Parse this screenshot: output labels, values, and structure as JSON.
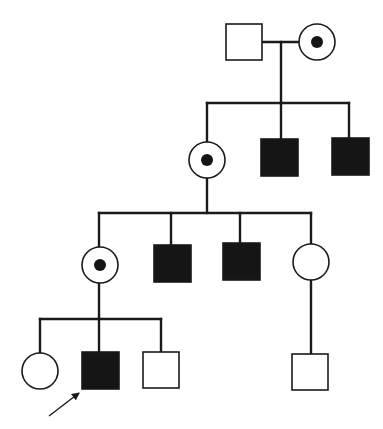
{
  "diagram": {
    "type": "pedigree",
    "colors": {
      "line": "#1a1a1a",
      "affected_fill": "#151515",
      "background": "#ffffff"
    },
    "legend_semantics": {
      "square": "male",
      "circle": "female",
      "filled": "affected",
      "dot": "carrier",
      "arrow": "proband"
    },
    "individuals": [
      {
        "id": "I-1",
        "gen": 1,
        "sex": "male",
        "status": "unaffected",
        "shape": "square",
        "x": 226,
        "y": 24,
        "size": 36
      },
      {
        "id": "I-2",
        "gen": 1,
        "sex": "female",
        "status": "carrier",
        "shape": "circle",
        "cx": 317,
        "cy": 42,
        "r": 18
      },
      {
        "id": "II-1",
        "gen": 2,
        "sex": "female",
        "status": "carrier",
        "shape": "circle",
        "cx": 207,
        "cy": 160,
        "r": 18
      },
      {
        "id": "II-2",
        "gen": 2,
        "sex": "male",
        "status": "affected",
        "shape": "square",
        "x": 261,
        "y": 139,
        "size": 37
      },
      {
        "id": "II-3",
        "gen": 2,
        "sex": "male",
        "status": "affected",
        "shape": "square",
        "x": 332,
        "y": 138,
        "size": 37
      },
      {
        "id": "III-1",
        "gen": 3,
        "sex": "female",
        "status": "carrier",
        "shape": "circle",
        "cx": 100,
        "cy": 265,
        "r": 18
      },
      {
        "id": "III-2",
        "gen": 3,
        "sex": "male",
        "status": "affected",
        "shape": "square",
        "x": 154,
        "y": 245,
        "size": 37
      },
      {
        "id": "III-3",
        "gen": 3,
        "sex": "male",
        "status": "affected",
        "shape": "square",
        "x": 223,
        "y": 243,
        "size": 37
      },
      {
        "id": "III-4",
        "gen": 3,
        "sex": "female",
        "status": "unaffected",
        "shape": "circle",
        "cx": 311,
        "cy": 262,
        "r": 18
      },
      {
        "id": "IV-1",
        "gen": 4,
        "sex": "female",
        "status": "unaffected",
        "shape": "circle",
        "cx": 40,
        "cy": 371,
        "r": 18
      },
      {
        "id": "IV-2",
        "gen": 4,
        "sex": "male",
        "status": "affected",
        "shape": "square",
        "x": 82,
        "y": 352,
        "size": 37,
        "proband": true
      },
      {
        "id": "IV-3",
        "gen": 4,
        "sex": "male",
        "status": "unaffected",
        "shape": "square",
        "x": 143,
        "y": 352,
        "size": 36
      },
      {
        "id": "IV-4",
        "gen": 4,
        "sex": "male",
        "status": "unaffected",
        "shape": "square",
        "x": 292,
        "y": 354,
        "size": 36
      }
    ],
    "lines": [
      {
        "name": "marriage-line-gen1",
        "x1": 262,
        "y1": 42,
        "x2": 299,
        "y2": 42
      },
      {
        "name": "descent-line-gen1",
        "x1": 281,
        "y1": 42,
        "x2": 281,
        "y2": 103
      },
      {
        "name": "sibship-line-gen2",
        "x1": 207,
        "y1": 103,
        "x2": 349,
        "y2": 103
      },
      {
        "name": "drop-II-1",
        "x1": 207,
        "y1": 103,
        "x2": 207,
        "y2": 142
      },
      {
        "name": "drop-II-2",
        "x1": 281,
        "y1": 103,
        "x2": 281,
        "y2": 139
      },
      {
        "name": "drop-II-3",
        "x1": 349,
        "y1": 103,
        "x2": 349,
        "y2": 138
      },
      {
        "name": "descent-line-gen2",
        "x1": 207,
        "y1": 178,
        "x2": 207,
        "y2": 213
      },
      {
        "name": "sibship-line-gen3",
        "x1": 99,
        "y1": 213,
        "x2": 311,
        "y2": 213
      },
      {
        "name": "drop-III-1",
        "x1": 99,
        "y1": 213,
        "x2": 99,
        "y2": 247
      },
      {
        "name": "drop-III-2",
        "x1": 171,
        "y1": 213,
        "x2": 171,
        "y2": 245
      },
      {
        "name": "drop-III-3",
        "x1": 240,
        "y1": 213,
        "x2": 240,
        "y2": 243
      },
      {
        "name": "drop-III-4",
        "x1": 311,
        "y1": 213,
        "x2": 311,
        "y2": 244
      },
      {
        "name": "descent-line-III-1",
        "x1": 99,
        "y1": 283,
        "x2": 99,
        "y2": 319
      },
      {
        "name": "sibship-line-gen4",
        "x1": 40,
        "y1": 319,
        "x2": 161,
        "y2": 319
      },
      {
        "name": "drop-IV-1",
        "x1": 40,
        "y1": 319,
        "x2": 40,
        "y2": 353
      },
      {
        "name": "drop-IV-2",
        "x1": 99,
        "y1": 319,
        "x2": 99,
        "y2": 352
      },
      {
        "name": "drop-IV-3",
        "x1": 161,
        "y1": 319,
        "x2": 161,
        "y2": 352
      },
      {
        "name": "descent-line-III-4",
        "x1": 311,
        "y1": 280,
        "x2": 311,
        "y2": 354
      }
    ],
    "proband_arrow": {
      "x1": 49,
      "y1": 416,
      "x2": 79,
      "y2": 393
    }
  }
}
